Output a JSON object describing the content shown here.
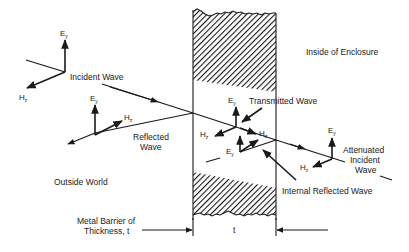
{
  "diagram": {
    "regions": {
      "outside": "Outside World",
      "inside": "Inside of Enclosure"
    },
    "waves": {
      "incident": "Incident Wave",
      "reflected_line1": "Reflected",
      "reflected_line2": "Wave",
      "transmitted": "Transmitted Wave",
      "internal_reflected": "Internal Reflected Wave",
      "attenuated_line1": "Attenuated",
      "attenuated_line2": "Incident",
      "attenuated_line3": "Wave"
    },
    "field_symbols": {
      "electric": "E",
      "electric_sub": "y",
      "magnetic": "H",
      "magnetic_sub": "z"
    },
    "barrier": {
      "label_line1": "Metal Barrier of",
      "label_line2": "Thickness, t",
      "thickness_symbol": "t"
    },
    "colors": {
      "ink": "#1a1a1a",
      "background": "#ffffff"
    }
  }
}
